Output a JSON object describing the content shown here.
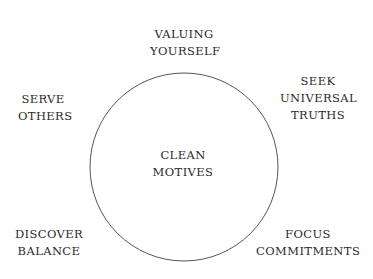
{
  "diagram": {
    "center": {
      "lines": [
        "CLEAN",
        "MOTIVES"
      ]
    },
    "nodes": [
      {
        "id": "valuing-yourself",
        "lines": [
          "VALUING",
          "YOURSELF"
        ]
      },
      {
        "id": "seek-universal-truths",
        "lines": [
          "SEEK",
          "UNIVERSAL",
          "TRUTHS"
        ]
      },
      {
        "id": "serve-others",
        "lines": [
          "SERVE",
          "OTHERS"
        ]
      },
      {
        "id": "discover-balance",
        "lines": [
          "DISCOVER",
          "BALANCE"
        ]
      },
      {
        "id": "focus-commitments",
        "lines": [
          "FOCUS",
          "COMMITMENTS"
        ]
      }
    ],
    "colors": {
      "stroke": "#555555",
      "text": "#2a2a2a",
      "background": "#ffffff"
    }
  }
}
